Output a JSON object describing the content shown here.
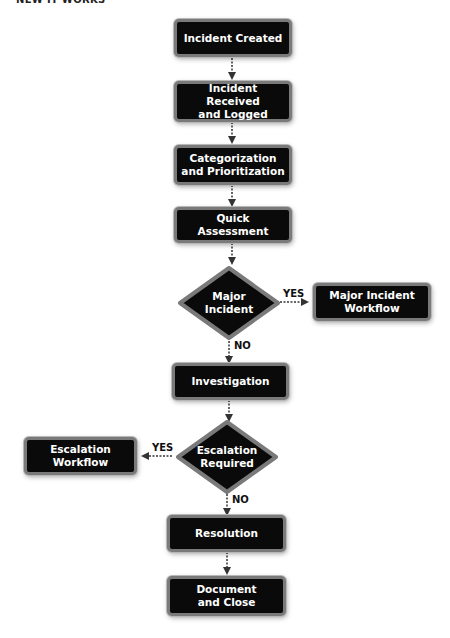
{
  "header": {
    "title_fragment": "NEW IT WORKS"
  },
  "flowchart": {
    "nodes": [
      {
        "id": "incident-created",
        "type": "process",
        "label": "Incident Created"
      },
      {
        "id": "received-logged",
        "type": "process",
        "label": "Incident Received and Logged"
      },
      {
        "id": "categorization",
        "type": "process",
        "label": "Categorization and Prioritization"
      },
      {
        "id": "quick-assessment",
        "type": "process",
        "label": "Quick Assessment"
      },
      {
        "id": "major-incident",
        "type": "decision",
        "label": "Major Incident"
      },
      {
        "id": "major-incident-workflow",
        "type": "process",
        "label": "Major Incident Workflow"
      },
      {
        "id": "investigation",
        "type": "process",
        "label": "Investigation"
      },
      {
        "id": "escalation-required",
        "type": "decision",
        "label": "Escalation Required"
      },
      {
        "id": "escalation-workflow",
        "type": "process",
        "label": "Escalation Workflow"
      },
      {
        "id": "resolution",
        "type": "process",
        "label": "Resolution"
      },
      {
        "id": "document-close",
        "type": "process",
        "label": "Document and Close"
      }
    ],
    "edges": [
      {
        "from": "incident-created",
        "to": "received-logged",
        "label": ""
      },
      {
        "from": "received-logged",
        "to": "categorization",
        "label": ""
      },
      {
        "from": "categorization",
        "to": "quick-assessment",
        "label": ""
      },
      {
        "from": "quick-assessment",
        "to": "major-incident",
        "label": ""
      },
      {
        "from": "major-incident",
        "to": "major-incident-workflow",
        "label": "YES"
      },
      {
        "from": "major-incident",
        "to": "investigation",
        "label": "NO"
      },
      {
        "from": "investigation",
        "to": "escalation-required",
        "label": ""
      },
      {
        "from": "escalation-required",
        "to": "escalation-workflow",
        "label": "YES"
      },
      {
        "from": "escalation-required",
        "to": "resolution",
        "label": "NO"
      },
      {
        "from": "resolution",
        "to": "document-close",
        "label": ""
      }
    ],
    "labels": {
      "incident_created": "Incident Created",
      "received_line1": "Incident Received",
      "received_line2": "and Logged",
      "categorization_line1": "Categorization",
      "categorization_line2": "and Prioritization",
      "quick_assessment": "Quick Assessment",
      "major_line1": "Major",
      "major_line2": "Incident",
      "major_workflow_line1": "Major Incident",
      "major_workflow_line2": "Workflow",
      "investigation": "Investigation",
      "escalation_req_line1": "Escalation",
      "escalation_req_line2": "Required",
      "escalation_workflow_line1": "Escalation",
      "escalation_workflow_line2": "Workflow",
      "resolution": "Resolution",
      "document_line1": "Document",
      "document_line2": "and Close",
      "yes": "YES",
      "no": "NO"
    },
    "colors": {
      "node_fill": "#0a0a0a",
      "node_border": "#7a7a7a",
      "node_text": "#ffffff",
      "connector": "#333333"
    }
  }
}
